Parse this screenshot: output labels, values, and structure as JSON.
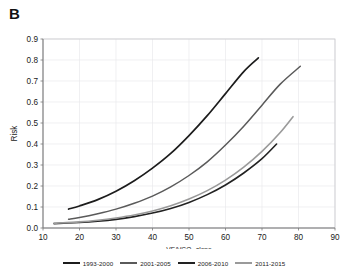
{
  "panel": {
    "label": "B"
  },
  "chart_data": {
    "type": "line",
    "title": "",
    "xlabel": "VE/VCO2 slope",
    "xlabel_main": "VE/VCO",
    "xlabel_sub": "2",
    "xlabel_tail": " slope",
    "ylabel": "Risk",
    "xlim": [
      10,
      90
    ],
    "ylim": [
      0.0,
      0.9
    ],
    "xticks": [
      10,
      20,
      30,
      40,
      50,
      60,
      70,
      80,
      90
    ],
    "yticks": [
      "0.0",
      "0.1",
      "0.2",
      "0.3",
      "0.4",
      "0.5",
      "0.6",
      "0.7",
      "0.8",
      "0.9"
    ],
    "grid": true,
    "legend_position": "bottom",
    "series": [
      {
        "name": "1993-2000",
        "color": "#1c1c1c",
        "width": 1.7,
        "x": [
          17,
          20,
          25,
          30,
          35,
          40,
          45,
          50,
          55,
          60,
          65,
          69
        ],
        "y": [
          0.09,
          0.105,
          0.135,
          0.175,
          0.225,
          0.285,
          0.355,
          0.44,
          0.535,
          0.64,
          0.745,
          0.81
        ]
      },
      {
        "name": "2001-2005",
        "color": "#5a5a5a",
        "width": 1.5,
        "x": [
          17,
          20,
          25,
          30,
          35,
          40,
          45,
          50,
          55,
          60,
          65,
          70,
          75,
          80.5
        ],
        "y": [
          0.042,
          0.05,
          0.068,
          0.09,
          0.118,
          0.152,
          0.196,
          0.25,
          0.315,
          0.395,
          0.485,
          0.585,
          0.685,
          0.77
        ]
      },
      {
        "name": "2006-2010",
        "color": "#222222",
        "width": 1.6,
        "x": [
          13,
          20,
          25,
          30,
          35,
          40,
          45,
          50,
          55,
          60,
          65,
          70,
          74
        ],
        "y": [
          0.021,
          0.026,
          0.032,
          0.041,
          0.054,
          0.071,
          0.093,
          0.122,
          0.159,
          0.205,
          0.262,
          0.33,
          0.4
        ]
      },
      {
        "name": "2011-2015",
        "color": "#9a9a9a",
        "width": 1.6,
        "x": [
          13,
          20,
          25,
          30,
          35,
          40,
          45,
          50,
          55,
          60,
          65,
          70,
          75,
          78.5
        ],
        "y": [
          0.022,
          0.029,
          0.037,
          0.048,
          0.062,
          0.081,
          0.106,
          0.138,
          0.178,
          0.228,
          0.29,
          0.365,
          0.455,
          0.53
        ]
      }
    ]
  },
  "legend": {
    "items": [
      {
        "label": "1993-2000",
        "color": "#1c1c1c"
      },
      {
        "label": "2001-2005",
        "color": "#5a5a5a"
      },
      {
        "label": "2006-2010",
        "color": "#222222"
      },
      {
        "label": "2011-2015",
        "color": "#9a9a9a"
      }
    ]
  }
}
